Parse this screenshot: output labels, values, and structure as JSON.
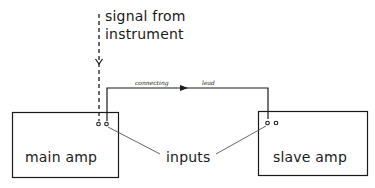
{
  "diagram": {
    "signal_label_line1": "signal from",
    "signal_label_line2": "instrument",
    "lead_label_part1": "connecting",
    "lead_label_part2": "lead",
    "main_box_label": "main amp",
    "slave_box_label": "slave amp",
    "inputs_label": "inputs",
    "colors": {
      "ink": "#1a1a1a",
      "leader": "#555555",
      "background": "#ffffff"
    }
  }
}
